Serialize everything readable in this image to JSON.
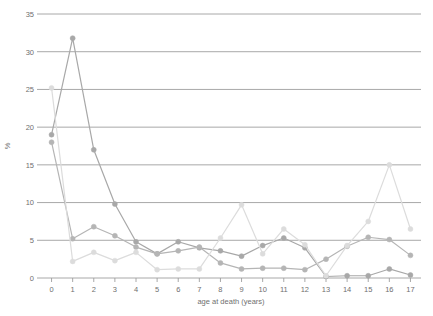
{
  "chart_data": {
    "type": "line",
    "title": "",
    "xlabel": "age at death (years)",
    "ylabel": "%",
    "xlim": [
      -0.5,
      17.5
    ],
    "ylim": [
      0,
      35
    ],
    "ytick_step": 5,
    "grid": "horizontal",
    "legend": "none",
    "x": [
      0,
      1,
      2,
      3,
      4,
      5,
      6,
      7,
      8,
      9,
      10,
      11,
      12,
      13,
      14,
      15,
      16,
      17
    ],
    "xticklabels": [
      "0",
      "1",
      "2",
      "3",
      "4",
      "5",
      "6",
      "7",
      "8",
      "9",
      "10",
      "11",
      "12",
      "13",
      "14",
      "15",
      "16",
      "17"
    ],
    "yticklabels": [
      "0",
      "5",
      "10",
      "15",
      "20",
      "25",
      "30",
      "35"
    ],
    "series": [
      {
        "name": "series-dark",
        "color": "#a8a8a8",
        "marker": "circle",
        "values": [
          19.0,
          31.8,
          17.0,
          9.8,
          4.8,
          3.2,
          4.8,
          4.0,
          3.6,
          2.9,
          4.3,
          5.3,
          4.0,
          0.2,
          0.3,
          0.3,
          1.2,
          0.4
        ]
      },
      {
        "name": "series-mid",
        "color": "#b5b5b5",
        "marker": "circle",
        "values": [
          18.0,
          5.2,
          6.8,
          5.6,
          4.1,
          3.2,
          3.6,
          4.1,
          2.0,
          1.2,
          1.3,
          1.3,
          1.1,
          2.5,
          4.2,
          5.4,
          5.1,
          3.0
        ]
      },
      {
        "name": "series-light",
        "color": "#dcdcdc",
        "marker": "circle",
        "values": [
          25.2,
          2.2,
          3.4,
          2.3,
          3.4,
          1.1,
          1.2,
          1.2,
          5.3,
          9.7,
          3.2,
          6.5,
          4.4,
          0.3,
          4.3,
          7.5,
          15.0,
          6.5
        ]
      }
    ]
  },
  "colors": {
    "grid": "#9e9e9e",
    "axis": "#9e9e9e",
    "tick_text": "#6f6f6f",
    "background": "#ffffff"
  }
}
